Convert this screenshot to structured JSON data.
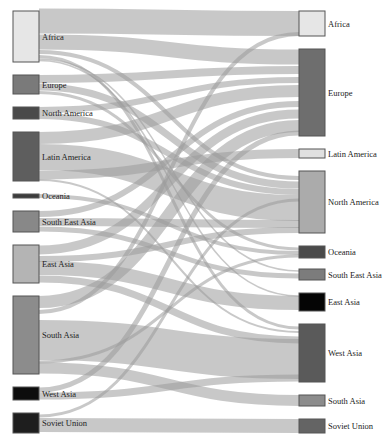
{
  "diagram": {
    "type": "sankey",
    "title": "",
    "left_nodes": [
      {
        "id": "src-africa",
        "label": "Africa",
        "y0": 11,
        "y1": 62,
        "color": "#e6e6e6"
      },
      {
        "id": "src-europe",
        "label": "Europe",
        "y0": 75,
        "y1": 94,
        "color": "#7a7a7a"
      },
      {
        "id": "src-north-america",
        "label": "North America",
        "y0": 107,
        "y1": 119,
        "color": "#4a4a4a"
      },
      {
        "id": "src-latin-america",
        "label": "Latin America",
        "y0": 132,
        "y1": 181,
        "color": "#5e5e5e"
      },
      {
        "id": "src-oceania",
        "label": "Oceania",
        "y0": 194,
        "y1": 198,
        "color": "#3c3c3c"
      },
      {
        "id": "src-south-east-asia",
        "label": "South East Asia",
        "y0": 211,
        "y1": 232,
        "color": "#888888"
      },
      {
        "id": "src-east-asia",
        "label": "East Asia",
        "y0": 245,
        "y1": 283,
        "color": "#b4b4b4"
      },
      {
        "id": "src-south-asia",
        "label": "South Asia",
        "y0": 296,
        "y1": 374,
        "color": "#8c8c8c"
      },
      {
        "id": "src-west-asia",
        "label": "West Asia",
        "y0": 387,
        "y1": 400,
        "color": "#0d0d0d"
      },
      {
        "id": "src-soviet-union",
        "label": "Soviet Union",
        "y0": 413,
        "y1": 433,
        "color": "#1e1e1e"
      }
    ],
    "right_nodes": [
      {
        "id": "dst-africa",
        "label": "Africa",
        "y0": 11,
        "y1": 36,
        "color": "#e6e6e6"
      },
      {
        "id": "dst-europe",
        "label": "Europe",
        "y0": 49,
        "y1": 136,
        "color": "#6e6e6e"
      },
      {
        "id": "dst-latin-america",
        "label": "Latin America",
        "y0": 149,
        "y1": 158,
        "color": "#e0e0e0"
      },
      {
        "id": "dst-north-america",
        "label": "North America",
        "y0": 171,
        "y1": 233,
        "color": "#ababab"
      },
      {
        "id": "dst-oceania",
        "label": "Oceania",
        "y0": 246,
        "y1": 258,
        "color": "#4a4a4a"
      },
      {
        "id": "dst-south-east-asia",
        "label": "South East Asia",
        "y0": 269,
        "y1": 280,
        "color": "#7c7c7c"
      },
      {
        "id": "dst-east-asia",
        "label": "East Asia",
        "y0": 293,
        "y1": 311,
        "color": "#050505"
      },
      {
        "id": "dst-west-asia",
        "label": "West Asia",
        "y0": 324,
        "y1": 382,
        "color": "#5a5a5a"
      },
      {
        "id": "dst-south-asia",
        "label": "South Asia",
        "y0": 395,
        "y1": 406,
        "color": "#8c8c8c"
      },
      {
        "id": "dst-soviet-union",
        "label": "Soviet Union",
        "y0": 419,
        "y1": 433,
        "color": "#646464"
      }
    ],
    "links": [
      {
        "source": "Africa",
        "target": "Africa",
        "sy": 21,
        "ty": 23.5,
        "w": 25
      },
      {
        "source": "Africa",
        "target": "Europe",
        "sy": 42,
        "ty": 57,
        "w": 15
      },
      {
        "source": "Africa",
        "target": "North America",
        "sy": 52,
        "ty": 178,
        "w": 4
      },
      {
        "source": "Africa",
        "target": "West Asia",
        "sy": 56.5,
        "ty": 328,
        "w": 3
      },
      {
        "source": "Africa",
        "target": "South East Asia",
        "sy": 59,
        "ty": 271,
        "w": 1.5
      },
      {
        "source": "Africa",
        "target": "East Asia",
        "sy": 60.5,
        "ty": 296,
        "w": 1.5
      },
      {
        "source": "Europe",
        "target": "Europe",
        "sy": 79,
        "ty": 70,
        "w": 8
      },
      {
        "source": "Europe",
        "target": "North America",
        "sy": 87,
        "ty": 185,
        "w": 7
      },
      {
        "source": "Europe",
        "target": "Oceania",
        "sy": 92.5,
        "ty": 249,
        "w": 3
      },
      {
        "source": "North America",
        "target": "Europe",
        "sy": 110,
        "ty": 80,
        "w": 6
      },
      {
        "source": "North America",
        "target": "North America",
        "sy": 116,
        "ty": 192,
        "w": 6
      },
      {
        "source": "Latin America",
        "target": "Europe",
        "sy": 138,
        "ty": 91,
        "w": 12
      },
      {
        "source": "Latin America",
        "target": "North America",
        "sy": 157,
        "ty": 208,
        "w": 26
      },
      {
        "source": "Latin America",
        "target": "Latin America",
        "sy": 175,
        "ty": 153.5,
        "w": 9
      },
      {
        "source": "Latin America",
        "target": "West Asia",
        "sy": 180,
        "ty": 332,
        "w": 2
      },
      {
        "source": "Oceania",
        "target": "Oceania",
        "sy": 196,
        "ty": 253,
        "w": 4
      },
      {
        "source": "South East Asia",
        "target": "Europe",
        "sy": 214,
        "ty": 104,
        "w": 6
      },
      {
        "source": "South East Asia",
        "target": "North America",
        "sy": 222,
        "ty": 224,
        "w": 8
      },
      {
        "source": "South East Asia",
        "target": "South East Asia",
        "sy": 229,
        "ty": 276,
        "w": 5
      },
      {
        "source": "East Asia",
        "target": "Europe",
        "sy": 250,
        "ty": 114,
        "w": 9
      },
      {
        "source": "East Asia",
        "target": "North America",
        "sy": 259,
        "ty": 230,
        "w": 6
      },
      {
        "source": "East Asia",
        "target": "East Asia",
        "sy": 268,
        "ty": 303,
        "w": 14
      },
      {
        "source": "East Asia",
        "target": "West Asia",
        "sy": 279,
        "ty": 340,
        "w": 7
      },
      {
        "source": "South Asia",
        "target": "Europe",
        "sy": 302,
        "ty": 126,
        "w": 12
      },
      {
        "source": "South Asia",
        "target": "Africa",
        "sy": 312,
        "ty": 34,
        "w": 4
      },
      {
        "source": "South Asia",
        "target": "West Asia",
        "sy": 340,
        "ty": 359,
        "w": 40
      },
      {
        "source": "South Asia",
        "target": "Oceania",
        "sy": 362,
        "ty": 256,
        "w": 3
      },
      {
        "source": "South Asia",
        "target": "South Asia",
        "sy": 368,
        "ty": 400.5,
        "w": 11
      },
      {
        "source": "West Asia",
        "target": "Europe",
        "sy": 390,
        "ty": 133,
        "w": 5
      },
      {
        "source": "West Asia",
        "target": "West Asia",
        "sy": 396,
        "ty": 378,
        "w": 7
      },
      {
        "source": "Soviet Union",
        "target": "Soviet Union",
        "sy": 425,
        "ty": 426,
        "w": 14
      },
      {
        "source": "Soviet Union",
        "target": "North America",
        "sy": 416,
        "ty": 200,
        "w": 3
      }
    ],
    "layout": {
      "left_x0": 13,
      "left_x1": 39,
      "right_x0": 299,
      "right_x1": 325
    }
  }
}
